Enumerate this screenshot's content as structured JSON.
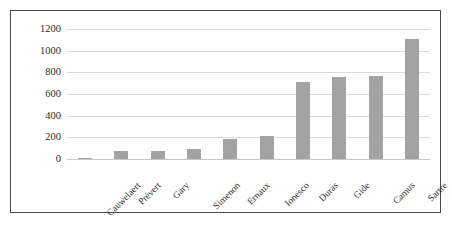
{
  "chart_data": {
    "type": "bar",
    "title": "",
    "subtitle": "",
    "xlabel": "",
    "ylabel": "",
    "categories": [
      "Cauwelaert",
      "Prévert",
      "Gary",
      "Simenon",
      "Ernaux",
      "Ionesco",
      "Duras",
      "Gide",
      "Camus",
      "Sartre"
    ],
    "values": [
      2,
      75,
      78,
      88,
      185,
      210,
      715,
      760,
      765,
      1105
    ],
    "series": [
      {
        "name": "",
        "values": [
          2,
          75,
          78,
          88,
          185,
          210,
          715,
          760,
          765,
          1105
        ]
      }
    ],
    "ylim": [
      0,
      1200
    ],
    "yticks": [
      0,
      200,
      400,
      600,
      800,
      1000,
      1200
    ],
    "ytick_labels": [
      "0",
      "200",
      "400",
      "600",
      "800",
      "1000",
      "1200"
    ],
    "grid": true,
    "legend": false,
    "legend_position": "none",
    "bar_color": "#a3a3a3",
    "gridline_color": "#d9d9d9",
    "border_color": "#4a4a4a",
    "text_color": "#2b2b2b",
    "xtick_rotation": -45
  }
}
